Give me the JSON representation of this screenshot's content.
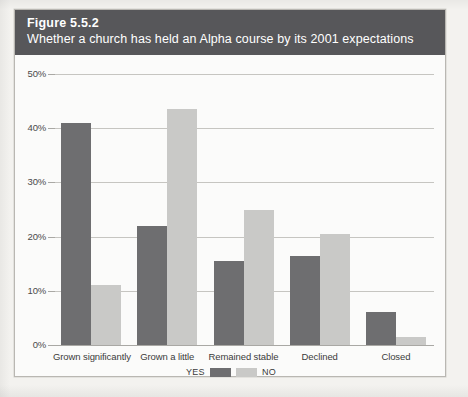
{
  "figure": {
    "number": "Figure 5.5.2",
    "caption": "Whether a church has held an Alpha course by its 2001 expectations"
  },
  "colors": {
    "header_band": "#57575a",
    "yes_bar": "#6e6e70",
    "no_bar": "#c9c9c7",
    "gridline": "#c6c5c1",
    "page_background": "#f3f2ef",
    "chart_background": "#fbfbfa"
  },
  "legend": {
    "yes_label": "YES",
    "no_label": "NO"
  },
  "chart_data": {
    "type": "bar",
    "title": "Whether a church has held an Alpha course by its 2001 expectations",
    "subtitle": "Figure 5.5.2",
    "xlabel": "",
    "ylabel": "",
    "ylim": [
      0,
      50
    ],
    "ytick_labels": [
      "0%",
      "10%",
      "20%",
      "30%",
      "40%",
      "50%"
    ],
    "ytick_values": [
      0,
      10,
      20,
      30,
      40,
      50
    ],
    "grid": true,
    "legend_position": "bottom-center",
    "categories": [
      "Grown significantly",
      "Grown a little",
      "Remained stable",
      "Declined",
      "Closed"
    ],
    "series": [
      {
        "name": "YES",
        "color": "#6e6e70",
        "values": [
          41,
          22,
          15.5,
          16.5,
          6
        ]
      },
      {
        "name": "NO",
        "color": "#c9c9c7",
        "values": [
          11,
          43.5,
          25,
          20.5,
          1.5
        ]
      }
    ]
  }
}
